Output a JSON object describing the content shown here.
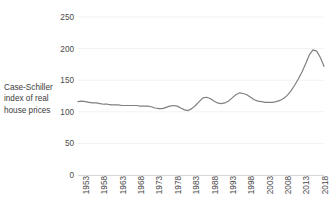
{
  "chart_data": {
    "type": "line",
    "title": "",
    "xlabel": "",
    "ylabel": "Case-Schiller index of real house prices",
    "ylim": [
      0,
      250
    ],
    "xlim": [
      1953,
      2020
    ],
    "yticks": [
      0,
      50,
      100,
      150,
      200,
      250
    ],
    "xticks": [
      1953,
      1958,
      1963,
      1968,
      1973,
      1978,
      1983,
      1988,
      1993,
      1998,
      2003,
      2008,
      2013,
      2018
    ],
    "grid": true,
    "legend": null,
    "series": [
      {
        "name": "Case-Schiller index of real house prices",
        "color": "#808080",
        "x": [
          1953,
          1954,
          1955,
          1956,
          1957,
          1958,
          1959,
          1960,
          1961,
          1962,
          1963,
          1964,
          1965,
          1966,
          1967,
          1968,
          1969,
          1970,
          1971,
          1972,
          1973,
          1974,
          1975,
          1976,
          1977,
          1978,
          1979,
          1980,
          1981,
          1982,
          1983,
          1984,
          1985,
          1986,
          1987,
          1988,
          1989,
          1990,
          1991,
          1992,
          1993,
          1994,
          1995,
          1996,
          1997,
          1998,
          1999,
          2000,
          2001,
          2002,
          2003,
          2004,
          2005,
          2006,
          2007,
          2008,
          2009,
          2010,
          2011,
          2012,
          2013,
          2014,
          2015,
          2016,
          2017,
          2018,
          2019,
          2020
        ],
        "y": [
          116,
          117,
          116,
          115,
          114,
          114,
          113,
          112,
          112,
          111,
          111,
          111,
          110,
          110,
          110,
          110,
          110,
          109,
          109,
          109,
          108,
          106,
          105,
          105,
          107,
          109,
          110,
          109,
          106,
          103,
          102,
          105,
          110,
          116,
          122,
          123,
          121,
          117,
          114,
          113,
          114,
          117,
          122,
          127,
          130,
          129,
          127,
          123,
          119,
          117,
          116,
          115,
          115,
          115,
          116,
          118,
          121,
          126,
          133,
          142,
          152,
          163,
          176,
          190,
          198,
          196,
          186,
          172
        ]
      }
    ],
    "series_points": [
      [
        1953,
        116
      ],
      [
        1955,
        116
      ],
      [
        1957,
        114
      ],
      [
        1960,
        112
      ],
      [
        1963,
        111
      ],
      [
        1966,
        110
      ],
      [
        1969,
        110
      ],
      [
        1971,
        109
      ],
      [
        1973,
        108
      ],
      [
        1974,
        106
      ],
      [
        1975,
        105
      ],
      [
        1976,
        105
      ],
      [
        1977,
        107
      ],
      [
        1978,
        110
      ],
      [
        1979,
        112
      ],
      [
        1980,
        109
      ],
      [
        1981,
        106
      ],
      [
        1982,
        103
      ],
      [
        1983,
        102
      ],
      [
        1984,
        106
      ],
      [
        1985,
        112
      ],
      [
        1986,
        118
      ],
      [
        1987,
        123
      ],
      [
        1988,
        122
      ],
      [
        1989,
        120
      ],
      [
        1990,
        117
      ],
      [
        1991,
        115
      ],
      [
        1992,
        114
      ],
      [
        1993,
        114
      ],
      [
        1994,
        117
      ],
      [
        1995,
        121
      ],
      [
        1996,
        126
      ],
      [
        1997,
        129
      ],
      [
        1998,
        130
      ],
      [
        1999,
        128
      ],
      [
        2000,
        125
      ],
      [
        2001,
        120
      ],
      [
        2002,
        117
      ],
      [
        2003,
        116
      ],
      [
        2004,
        115
      ],
      [
        2005,
        115
      ],
      [
        2006,
        116
      ],
      [
        2007,
        118
      ],
      [
        2008,
        121
      ],
      [
        2009,
        127
      ],
      [
        2010,
        134
      ],
      [
        2011,
        143
      ],
      [
        2012,
        154
      ],
      [
        2013,
        168
      ],
      [
        2014,
        183
      ],
      [
        2015,
        196
      ],
      [
        2016,
        198
      ],
      [
        2017,
        190
      ],
      [
        2018,
        175
      ],
      [
        2019,
        160
      ],
      [
        2020,
        148
      ]
    ]
  },
  "axis": {
    "y_title": "Case-Schiller index of real house prices",
    "y_title_lines": [
      "Case-Schiller",
      "index of real",
      "house prices"
    ],
    "y_tick_labels": [
      "250",
      "200",
      "150",
      "100",
      "50",
      "0"
    ],
    "x_tick_labels": [
      "1953",
      "1958",
      "1963",
      "1968",
      "1973",
      "1978",
      "1983",
      "1988",
      "1993",
      "1998",
      "2003",
      "2008",
      "2013",
      "2018"
    ]
  },
  "colors": {
    "line": "#808080",
    "grid": "#f2f2f2",
    "axis_text": "#4a4a4a",
    "title_text": "#3b3b3b",
    "background": "#ffffff"
  }
}
